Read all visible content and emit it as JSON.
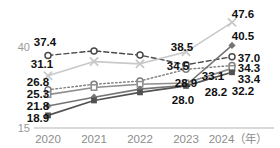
{
  "chart_data": {
    "type": "line",
    "title": "",
    "xlabel": "年",
    "ylabel": "",
    "categories": [
      "2020",
      "2021",
      "2022",
      "2023",
      "2024"
    ],
    "x_axis_unit_label": "2024（年）",
    "ytick_labels": [
      "40",
      "15"
    ],
    "ytick_values": [
      40,
      15
    ],
    "ylim": [
      15,
      50
    ],
    "grid": false,
    "legend": "none",
    "series": [
      {
        "name": "series-open-circle-dashed",
        "marker": "open-circle",
        "line_style": "dashed",
        "color": "#4a4a4a",
        "values": [
          37.4,
          38.8,
          37.5,
          34.5,
          37.0
        ],
        "labels": [
          "37.4",
          "",
          "",
          "34.5",
          "37.0"
        ]
      },
      {
        "name": "series-cross-light",
        "marker": "x-cross",
        "line_style": "solid",
        "color": "#c9c9c9",
        "values": [
          31.1,
          35.5,
          34.8,
          38.5,
          47.6
        ],
        "labels": [
          "31.1",
          "",
          "",
          "38.5",
          "47.6"
        ]
      },
      {
        "name": "series-open-circle-dotted",
        "marker": "open-circle",
        "line_style": "dotted",
        "color": "#7d7d7d",
        "values": [
          26.8,
          28.5,
          29.5,
          33.1,
          34.3
        ],
        "labels": [
          "26.8",
          "",
          "",
          "33.1",
          "34.3"
        ]
      },
      {
        "name": "series-small-square",
        "marker": "square",
        "line_style": "solid",
        "color": "#8e8e8e",
        "values": [
          25.3,
          27.5,
          28.5,
          28.9,
          33.4
        ],
        "labels": [
          "25.3",
          "",
          "",
          "28.9",
          "33.4"
        ]
      },
      {
        "name": "series-diamond",
        "marker": "diamond",
        "line_style": "solid",
        "color": "#747474",
        "values": [
          21.8,
          24.5,
          27.0,
          28.2,
          40.5
        ],
        "labels": [
          "21.8",
          "",
          "",
          "28.2",
          "40.5"
        ]
      },
      {
        "name": "series-filled-square-dark",
        "marker": "filled-square",
        "line_style": "solid",
        "color": "#525252",
        "values": [
          18.9,
          23.5,
          26.0,
          28.0,
          32.2
        ],
        "labels": [
          "18.9",
          "",
          "",
          "28.0",
          "32.2"
        ]
      }
    ],
    "value_labels": [
      {
        "text": "37.4",
        "x": 45,
        "y": 46
      },
      {
        "text": "31.1",
        "x": 42,
        "y": 68
      },
      {
        "text": "26.8",
        "x": 38,
        "y": 86
      },
      {
        "text": "25.3",
        "x": 38,
        "y": 98
      },
      {
        "text": "21.8",
        "x": 38,
        "y": 110
      },
      {
        "text": "18.9",
        "x": 38,
        "y": 122
      },
      {
        "text": "38.5",
        "x": 182,
        "y": 51
      },
      {
        "text": "34.5",
        "x": 178,
        "y": 70
      },
      {
        "text": "33.1",
        "x": 213,
        "y": 80
      },
      {
        "text": "28.9",
        "x": 186,
        "y": 87
      },
      {
        "text": "28.2",
        "x": 216,
        "y": 96
      },
      {
        "text": "28.0",
        "x": 183,
        "y": 104
      },
      {
        "text": "47.6",
        "x": 243,
        "y": 18
      },
      {
        "text": "40.5",
        "x": 243,
        "y": 40
      },
      {
        "text": "37.0",
        "x": 249,
        "y": 62
      },
      {
        "text": "34.3",
        "x": 249,
        "y": 72
      },
      {
        "text": "33.4",
        "x": 249,
        "y": 83
      },
      {
        "text": "32.2",
        "x": 243,
        "y": 95
      }
    ]
  }
}
